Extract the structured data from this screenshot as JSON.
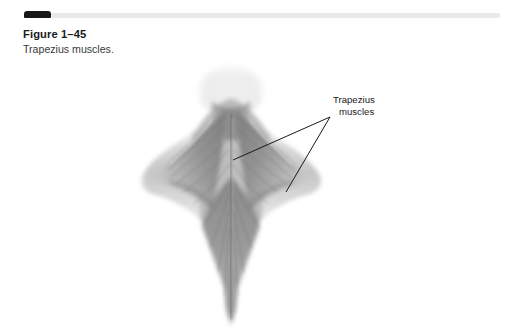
{
  "page": {
    "background_color": "#ffffff",
    "width": 522,
    "height": 333
  },
  "top_bar": {
    "tab_name": "chapter-marker-tab",
    "tab_color": "#17171a",
    "rule_color": "#e9e9e9"
  },
  "caption": {
    "figure_number": "Figure 1–45",
    "figure_text": "Trapezius muscles."
  },
  "illustration": {
    "name": "trapezius-muscles-anatomy",
    "description": "Grayscale posterior view of human head, neck, shoulders and upper back showing the diamond-shaped trapezius muscles",
    "palette": {
      "muscle_mid": "#8d8d8d",
      "muscle_dark": "#6a6a6a",
      "muscle_light": "#bcbcbc",
      "skin_light": "#d5d5d5",
      "highlight": "#f2f2f2",
      "outline": "#5a5a5a"
    }
  },
  "annotation": {
    "label_line1": "Trapezius",
    "label_line2": "muscles",
    "leader_color": "#1a1a1a",
    "leaders": [
      {
        "name": "leader-upper-left",
        "x1": 330,
        "y1": 117,
        "x2": 233,
        "y2": 160
      },
      {
        "name": "leader-lower-left",
        "x1": 330,
        "y1": 117,
        "x2": 286,
        "y2": 192
      }
    ]
  }
}
